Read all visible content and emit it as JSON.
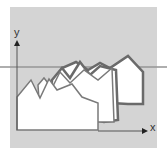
{
  "diagram": {
    "type": "stacked-3d-profile",
    "axes": {
      "x_label": "x",
      "y_label": "y"
    },
    "layers": [
      {
        "name": "back",
        "stroke": "#666666",
        "fill": "#ffffff"
      },
      {
        "name": "middle-back",
        "stroke": "#666666",
        "fill": "#ffffff"
      },
      {
        "name": "middle-front",
        "stroke": "#777777",
        "fill": "#ffffff"
      },
      {
        "name": "front",
        "stroke": "#777777",
        "fill": "#ffffff"
      }
    ],
    "colors": {
      "panel": "#d4d4d4",
      "axis": "#555555",
      "stripe": "#999999"
    }
  }
}
